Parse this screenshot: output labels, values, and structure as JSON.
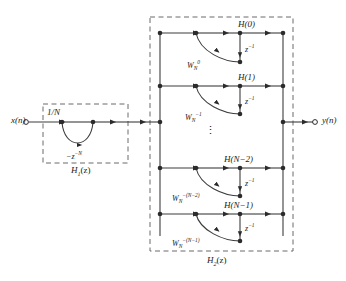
{
  "diagram": {
    "type": "signal-flow-graph",
    "input": {
      "label": "x(n)"
    },
    "output": {
      "label": "y(n)"
    },
    "blocks": [
      {
        "id": "H1",
        "label": "H1(z)",
        "label_base": "H",
        "label_sub": "1",
        "label_tail": "(z)",
        "gain": "1/N",
        "feedback": "−z−N",
        "feedback_base": "−z",
        "feedback_sup": "−N"
      },
      {
        "id": "H2",
        "label": "H2(z)",
        "label_base": "H",
        "label_sub": "2",
        "label_tail": "(z)",
        "ellipsis": "⋮"
      }
    ],
    "branches": [
      {
        "coef_base": "W",
        "coef_sub": "N",
        "coef_sup": "0",
        "delay": "z−1",
        "delay_base": "z",
        "delay_sup": "−1",
        "gain": "H(0)"
      },
      {
        "coef_base": "W",
        "coef_sub": "N",
        "coef_sup": "−1",
        "delay": "z−1",
        "delay_base": "z",
        "delay_sup": "−1",
        "gain": "H(1)"
      },
      {
        "coef_base": "W",
        "coef_sub": "N",
        "coef_sup": "−(N−2)",
        "delay": "z−1",
        "delay_base": "z",
        "delay_sup": "−1",
        "gain": "H(N−2)"
      },
      {
        "coef_base": "W",
        "coef_sub": "N",
        "coef_sup": "−(N−1)",
        "delay": "z−1",
        "delay_base": "z",
        "delay_sup": "−1",
        "gain": "H(N−1)"
      }
    ],
    "colors": {
      "line": "#3d3d3d",
      "dashed": "#6b6b6b",
      "text": "#1a1a1a",
      "background": "#ffffff"
    }
  }
}
